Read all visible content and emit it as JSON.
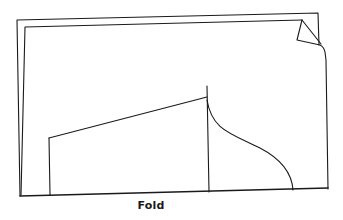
{
  "diagram": {
    "caption": "Fold",
    "stroke_color": "#1a1a1a",
    "background_color": "#ffffff",
    "elements": {
      "outer_sheet": "Back layer of folded fabric",
      "inner_sheet": "Front layer of folded fabric",
      "corner_flap": "Curled-up top-right corner",
      "pattern_piece": "Pattern outline with straight left edge, slanted top edge, center line and curved right edge",
      "fold_line": "Bottom edge of fabric marked as fold"
    }
  }
}
